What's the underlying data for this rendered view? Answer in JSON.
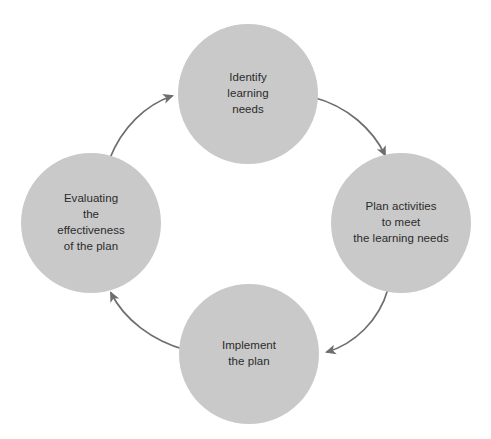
{
  "diagram": {
    "type": "cycle-diagram",
    "direction": "clockwise",
    "background_color": "#ffffff",
    "node_fill_color": "#c9c9c9",
    "node_text_color": "#2b2b2b",
    "arrow_color": "#6e6e6e",
    "nodes": [
      {
        "id": "identify",
        "label": "Identify\nlearning\nneeds",
        "position": "top",
        "center_x": 248,
        "center_y": 94,
        "diameter": 140
      },
      {
        "id": "plan",
        "label": "Plan activities\nto meet\nthe learning needs",
        "position": "right",
        "center_x": 401,
        "center_y": 223,
        "diameter": 140
      },
      {
        "id": "implement",
        "label": "Implement\nthe plan",
        "position": "bottom",
        "center_x": 249,
        "center_y": 354,
        "diameter": 140
      },
      {
        "id": "evaluate",
        "label": "Evaluating\nthe\neffectiveness\nof the plan",
        "position": "left",
        "center_x": 91,
        "center_y": 223,
        "diameter": 140
      }
    ],
    "arrows": [
      {
        "id": "identify-to-plan",
        "from": "identify",
        "to": "plan"
      },
      {
        "id": "plan-to-implement",
        "from": "plan",
        "to": "implement"
      },
      {
        "id": "implement-to-evaluate",
        "from": "implement",
        "to": "evaluate"
      },
      {
        "id": "evaluate-to-identify",
        "from": "evaluate",
        "to": "identify"
      }
    ]
  }
}
